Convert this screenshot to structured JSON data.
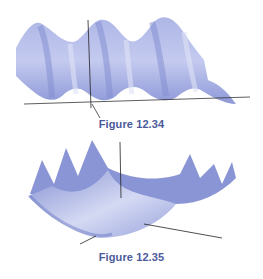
{
  "figures": [
    {
      "caption": "Figure 12.34",
      "description": "3D surface plot of a periodic wave-like surface with three crests, shown with coordinate axes",
      "surface_color": "#8b96d6"
    },
    {
      "caption": "Figure 12.35",
      "description": "3D surface plot of a parabolic trough with oscillating ridges, shown with coordinate axes",
      "surface_color": "#8b96d6"
    }
  ],
  "colors": {
    "caption": "#4a5a9a",
    "surface_light": "#c9cff0",
    "surface_mid": "#9ea8e0",
    "surface_dark": "#6f7cc6",
    "axis": "#222222"
  }
}
